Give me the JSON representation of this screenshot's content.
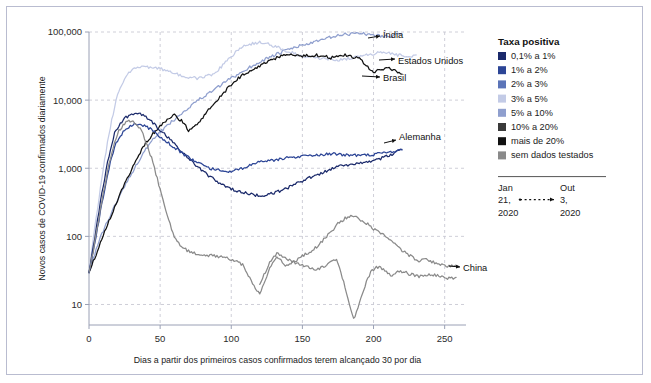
{
  "figure": {
    "background": "#ffffff",
    "border_color": "#b9bcd0"
  },
  "axes": {
    "y_label": "Novos casos de COVID-19 confirmados diariamente",
    "x_label": "Dias a partir dos primeiros casos confirmados terem alcançado 30 por dia",
    "y_ticks": [
      "10",
      "100",
      "1,000",
      "10,000",
      "100,000"
    ],
    "x_ticks": [
      "0",
      "50",
      "100",
      "150",
      "200",
      "250"
    ]
  },
  "legend": {
    "title": "Taxa positiva",
    "items": [
      {
        "label": "0,1% a 1%",
        "color": "#1b2a6b"
      },
      {
        "label": "1% a 2%",
        "color": "#2c4596"
      },
      {
        "label": "2% a 3%",
        "color": "#5b74b8"
      },
      {
        "label": "3% a 5%",
        "color": "#c3cbe6"
      },
      {
        "label": "5% a 10%",
        "color": "#8f9fce"
      },
      {
        "label": "10% a 20%",
        "color": "#3a3a3a"
      },
      {
        "label": "mais de 20%",
        "color": "#111111"
      },
      {
        "label": "sem dados testados",
        "color": "#8a8a8a"
      }
    ],
    "date_range": {
      "start": [
        "Jan",
        "21,",
        "2020"
      ],
      "end": [
        "Out",
        "3,",
        "2020"
      ]
    }
  },
  "series_labels": [
    {
      "name": "India",
      "text": "Índia"
    },
    {
      "name": "EstadosUnidos",
      "text": "Estados Unidos"
    },
    {
      "name": "Brasil",
      "text": "Brasil"
    },
    {
      "name": "Alemanha",
      "text": "Alemanha"
    },
    {
      "name": "China",
      "text": "China"
    }
  ],
  "chart_data": {
    "type": "line",
    "title": "",
    "xlabel": "Dias a partir dos primeiros casos confirmados terem alcançado 30 por dia",
    "ylabel": "Novos casos de COVID-19 confirmados diariamente",
    "yscale": "log",
    "ylim": [
      5,
      100000
    ],
    "xlim": [
      0,
      265
    ],
    "grid": true,
    "legend_position": "right",
    "series": [
      {
        "name": "Índia",
        "color": "#8f9fce",
        "label_at": [
          215,
          95000
        ],
        "x": [
          0,
          4,
          8,
          12,
          16,
          20,
          24,
          28,
          32,
          36,
          40,
          45,
          50,
          55,
          60,
          65,
          70,
          75,
          80,
          85,
          90,
          95,
          100,
          105,
          110,
          115,
          120,
          125,
          130,
          135,
          140,
          145,
          150,
          155,
          160,
          165,
          170,
          175,
          180,
          185,
          190,
          195,
          200,
          205,
          210,
          215,
          220
        ],
        "y": [
          30,
          55,
          95,
          150,
          230,
          330,
          500,
          720,
          1000,
          1400,
          1900,
          2600,
          3400,
          4200,
          5200,
          6400,
          7800,
          9500,
          11000,
          13000,
          15000,
          18000,
          21000,
          24000,
          28000,
          32000,
          36000,
          41000,
          45000,
          50000,
          55000,
          60000,
          64000,
          68000,
          72000,
          78000,
          84000,
          88000,
          92000,
          95000,
          97000,
          93000,
          90000,
          88000,
          86000,
          90000,
          93000
        ]
      },
      {
        "name": "Estados Unidos",
        "color": "#c3cbe6",
        "label_at": [
          232,
          48000
        ],
        "x": [
          0,
          3,
          6,
          9,
          12,
          15,
          18,
          21,
          25,
          30,
          35,
          40,
          45,
          50,
          55,
          60,
          65,
          70,
          75,
          80,
          85,
          90,
          95,
          100,
          105,
          110,
          115,
          120,
          125,
          130,
          135,
          140,
          145,
          150,
          155,
          160,
          165,
          170,
          175,
          180,
          185,
          190,
          195,
          200,
          205,
          210,
          215,
          220,
          225,
          230
        ],
        "y": [
          30,
          90,
          260,
          700,
          1800,
          4000,
          8000,
          14000,
          21000,
          28000,
          30000,
          31000,
          30000,
          29000,
          27000,
          25000,
          23000,
          22000,
          21000,
          21500,
          23000,
          27000,
          34000,
          44000,
          55000,
          63000,
          68000,
          70000,
          67000,
          62000,
          57000,
          52000,
          48000,
          45000,
          43000,
          42000,
          41000,
          40000,
          39000,
          40000,
          42000,
          44000,
          46000,
          48000,
          50000,
          49000,
          47000,
          45000,
          44000,
          46000
        ]
      },
      {
        "name": "Brasil",
        "color": "#111111",
        "label_at": [
          232,
          23000
        ],
        "x": [
          0,
          4,
          8,
          12,
          16,
          20,
          24,
          28,
          32,
          36,
          40,
          45,
          50,
          55,
          60,
          65,
          70,
          75,
          80,
          85,
          90,
          95,
          100,
          105,
          110,
          115,
          120,
          125,
          130,
          135,
          140,
          145,
          150,
          155,
          160,
          165,
          170,
          175,
          180,
          185,
          190,
          195,
          200,
          205,
          210,
          215,
          220
        ],
        "y": [
          30,
          48,
          80,
          130,
          210,
          340,
          520,
          800,
          1200,
          1700,
          2400,
          3200,
          4200,
          5200,
          6000,
          5000,
          3600,
          4200,
          5600,
          7600,
          10000,
          13000,
          17000,
          21000,
          25000,
          28000,
          32000,
          36000,
          40000,
          44000,
          46000,
          45000,
          44000,
          45000,
          46000,
          44000,
          42000,
          44000,
          46000,
          44000,
          40000,
          32000,
          25000,
          28000,
          30000,
          27000,
          24000
        ]
      },
      {
        "name": "Alemanha",
        "color": "#1b2a6b",
        "label_at": [
          222,
          2100
        ],
        "x": [
          0,
          3,
          6,
          9,
          12,
          15,
          18,
          22,
          26,
          30,
          34,
          38,
          42,
          46,
          50,
          55,
          60,
          65,
          70,
          75,
          80,
          85,
          90,
          95,
          100,
          105,
          110,
          115,
          120,
          125,
          130,
          135,
          140,
          145,
          150,
          155,
          160,
          165,
          170,
          175,
          180,
          185,
          190,
          195,
          200,
          205,
          210,
          215,
          220
        ],
        "y": [
          30,
          70,
          170,
          420,
          950,
          1900,
          3300,
          4600,
          5600,
          6200,
          6400,
          6000,
          5200,
          4400,
          3600,
          2900,
          2300,
          1800,
          1400,
          1100,
          900,
          760,
          640,
          560,
          500,
          460,
          430,
          410,
          400,
          410,
          430,
          470,
          520,
          580,
          650,
          720,
          800,
          880,
          960,
          1050,
          1100,
          1150,
          1200,
          1250,
          1300,
          1400,
          1500,
          1700,
          1900
        ]
      },
      {
        "name": "Alemanha-2",
        "color": "#2c4596",
        "label_at": null,
        "x": [
          0,
          3,
          6,
          9,
          12,
          15,
          18,
          22,
          26,
          30,
          34,
          38,
          42,
          46,
          50,
          55,
          60,
          65,
          70,
          75,
          80,
          85,
          90,
          95,
          100,
          105,
          110,
          115,
          120,
          125,
          130,
          135,
          140,
          145,
          150,
          155,
          160,
          165,
          170,
          175,
          180,
          185,
          190,
          195,
          200,
          205,
          210,
          215,
          220
        ],
        "y": [
          30,
          60,
          130,
          300,
          620,
          1200,
          2100,
          3000,
          3800,
          4300,
          4500,
          4300,
          3900,
          3400,
          2900,
          2400,
          2000,
          1700,
          1450,
          1250,
          1100,
          1000,
          950,
          920,
          900,
          950,
          1050,
          1150,
          1220,
          1280,
          1320,
          1380,
          1420,
          1450,
          1500,
          1550,
          1580,
          1600,
          1620,
          1600,
          1580,
          1560,
          1540,
          1560,
          1600,
          1650,
          1700,
          1780,
          1850
        ]
      },
      {
        "name": "China",
        "color": "#8a8a8a",
        "label_at": [
          238,
          40
        ],
        "x": [
          0,
          3,
          6,
          9,
          12,
          15,
          18,
          21,
          24,
          27,
          30,
          33,
          36,
          39,
          42,
          45,
          48,
          51,
          54,
          57,
          60,
          63,
          66,
          69,
          72,
          75,
          78,
          81,
          84,
          87,
          90,
          93,
          96,
          99,
          102,
          105,
          108,
          111,
          114,
          117,
          120,
          123,
          126,
          129,
          132,
          135,
          138,
          141,
          144,
          147,
          150,
          153,
          156,
          159,
          162,
          165,
          168,
          171,
          174,
          177,
          180,
          183,
          186,
          189,
          192,
          195,
          198,
          201,
          204,
          207,
          210,
          213,
          216,
          219,
          222,
          225,
          228,
          231,
          234,
          240,
          246,
          252,
          258
        ],
        "y": [
          30,
          60,
          140,
          330,
          700,
          1400,
          2400,
          3500,
          4300,
          4800,
          5000,
          4600,
          3800,
          2800,
          1900,
          1200,
          700,
          400,
          230,
          150,
          100,
          80,
          70,
          62,
          58,
          56,
          54,
          53,
          52,
          52,
          51,
          50,
          48,
          46,
          44,
          42,
          38,
          30,
          22,
          17,
          14,
          20,
          30,
          42,
          48,
          43,
          38,
          40,
          42,
          40,
          38,
          36,
          34,
          33,
          34,
          36,
          40,
          46,
          44,
          30,
          18,
          10,
          6,
          9,
          14,
          22,
          30,
          34,
          36,
          33,
          28,
          27,
          29,
          31,
          30,
          28,
          27,
          26,
          26,
          28,
          26,
          24,
          25
        ]
      },
      {
        "name": "China-late",
        "color": "#8a8a8a",
        "label_at": null,
        "x": [
          120,
          124,
          128,
          132,
          136,
          140,
          144,
          148,
          152,
          156,
          160,
          164,
          168,
          172,
          176,
          180,
          184,
          188,
          192,
          196,
          200,
          204,
          208,
          212,
          216,
          220,
          224,
          228,
          232,
          236,
          240,
          244,
          248,
          252,
          256,
          260
        ],
        "y": [
          20,
          30,
          45,
          55,
          52,
          46,
          42,
          48,
          55,
          60,
          70,
          85,
          105,
          130,
          160,
          185,
          200,
          190,
          170,
          150,
          130,
          115,
          100,
          88,
          74,
          62,
          55,
          48,
          44,
          46,
          44,
          40,
          38,
          36,
          38,
          36
        ]
      }
    ]
  }
}
